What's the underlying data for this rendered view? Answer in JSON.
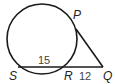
{
  "diagram": {
    "type": "circle-tangent-secant",
    "points": {
      "P": "P",
      "Q": "Q",
      "R": "R",
      "S": "S"
    },
    "segments": {
      "SR": "15",
      "RQ": "12"
    },
    "colors": {
      "stroke": "#1a1a1a",
      "label": "#222222",
      "number": "#444444"
    }
  }
}
